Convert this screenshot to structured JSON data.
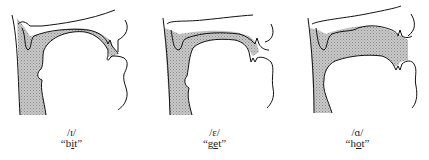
{
  "figure": {
    "panels": [
      {
        "ipa": "/ɪ/",
        "word_open": "“",
        "word_pre": "b",
        "word_focus": "i",
        "word_post": "t",
        "word_close": "”"
      },
      {
        "ipa": "/ɛ/",
        "word_open": "“",
        "word_pre": "g",
        "word_focus": "e",
        "word_post": "t",
        "word_close": "”"
      },
      {
        "ipa": "/ɑ/",
        "word_open": "“",
        "word_pre": "h",
        "word_focus": "o",
        "word_post": "t",
        "word_close": "”"
      }
    ]
  }
}
